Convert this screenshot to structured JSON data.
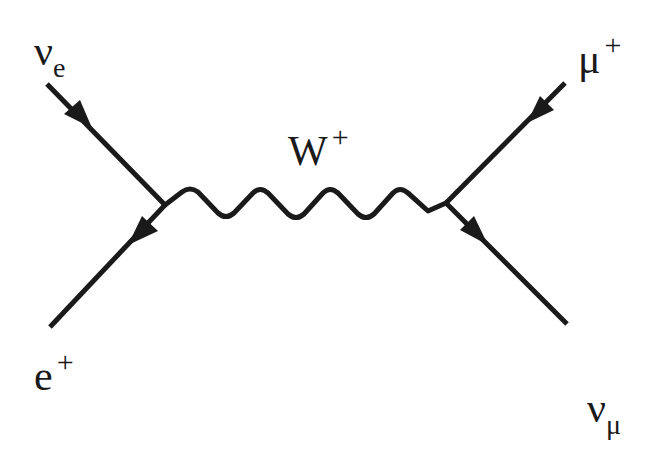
{
  "diagram": {
    "type": "Feynman diagram",
    "process": "nu_e + mu+ -> e+ + nu_mu via W+ exchange",
    "boson": {
      "label_main": "W",
      "label_sup": "+"
    },
    "particles": {
      "top_left": {
        "label_main": "ν",
        "label_sub": "e",
        "arrow": "inward"
      },
      "bottom_left": {
        "label_main": "e",
        "label_sup": "+",
        "arrow": "outward-reversed"
      },
      "top_right": {
        "label_main": "μ",
        "label_sup": "+",
        "arrow": "inward"
      },
      "bottom_right": {
        "label_main": "ν",
        "label_sub": "μ",
        "arrow": "outward"
      }
    },
    "vertices": [
      {
        "name": "left",
        "x": 165,
        "y": 205
      },
      {
        "name": "right",
        "x": 446,
        "y": 203
      }
    ],
    "colors": {
      "ink": "#1a1a1a",
      "background": "#ffffff"
    }
  }
}
